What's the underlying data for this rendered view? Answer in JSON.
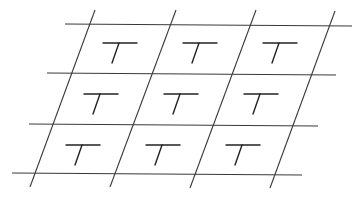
{
  "diagram": {
    "rows": 3,
    "cols": 3,
    "cell_letter": "T",
    "cells": [
      [
        "T",
        "T",
        "T"
      ],
      [
        "T",
        "T",
        "T"
      ],
      [
        "T",
        "T",
        "T"
      ]
    ],
    "colors": {
      "lines": "#3a3a3a",
      "glyph": "#222222",
      "background": "#ffffff"
    }
  }
}
